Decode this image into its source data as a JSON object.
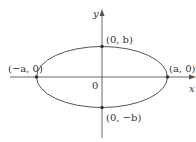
{
  "diagram": {
    "axes": {
      "x_label": "x",
      "y_label": "y",
      "origin_label": "0"
    },
    "points": [
      {
        "id": "right-vertex",
        "label": "(a, 0)"
      },
      {
        "id": "left-vertex",
        "label": "(−a, 0)"
      },
      {
        "id": "top-covertex",
        "label": "(0, b)"
      },
      {
        "id": "bottom-covertex",
        "label": "(0, −b)"
      }
    ],
    "colors": {
      "line": "#555555",
      "text": "#333333",
      "background": "#ffffff"
    }
  }
}
